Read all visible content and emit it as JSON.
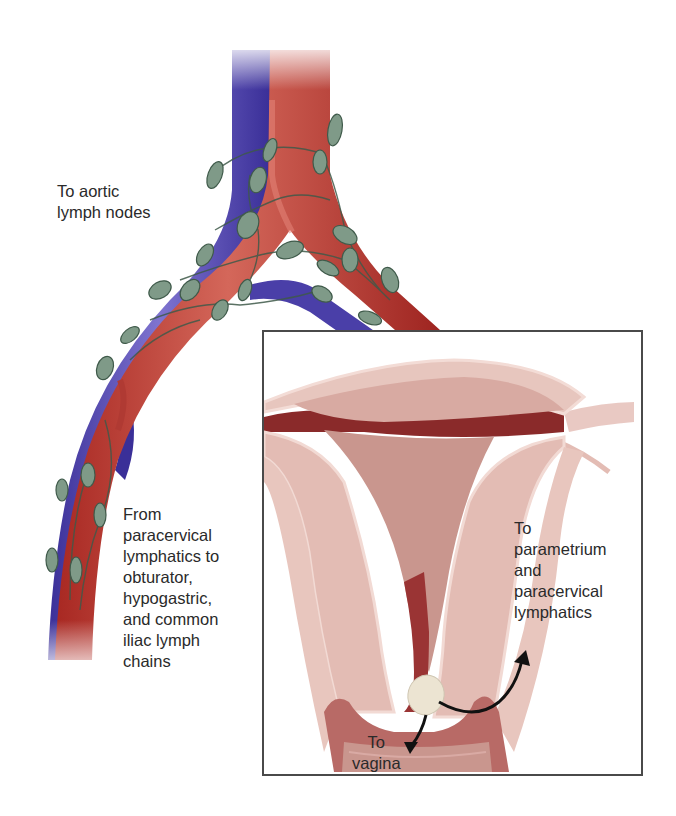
{
  "figure": {
    "colors": {
      "artery": "#b8302a",
      "artery_highlight": "#d9685c",
      "vein": "#4a3fa8",
      "vein_highlight": "#8a7fd8",
      "lymph_node": "#7f9a88",
      "lymph_node_outline": "#3f5a4a",
      "uterus_tissue": "#e3bcb4",
      "uterus_cavity": "#c9968e",
      "uterus_dark": "#8a2a2a",
      "tumor": "#ece4d2",
      "arrow": "#111111",
      "box_border": "#4a4a4a",
      "text": "#2a2a2a"
    }
  },
  "labels": {
    "aortic": "To aortic\nlymph nodes",
    "pelvic": "From\nparacervical\nlymphatics to\nobturator,\nhypogastric,\nand common\niliac lymph\nchains",
    "parametrium": "To\nparametrium\nand\nparacervical\nlymphatics",
    "vagina": "To\nvagina"
  },
  "inset": {
    "title": "Uterus and cervix with tumor (coronal section)"
  }
}
